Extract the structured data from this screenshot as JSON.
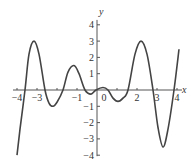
{
  "chart_data": {
    "type": "line",
    "title": "",
    "xlabel": "x",
    "ylabel": "y",
    "xlim": [
      -4,
      4.2
    ],
    "ylim": [
      -4,
      4.3
    ],
    "x_ticks": [
      -4,
      -3,
      -1,
      0,
      2,
      3,
      4
    ],
    "x_tick_labels": [
      "−4",
      "−3",
      "−1",
      "0",
      "2",
      "3",
      "4"
    ],
    "x_tick_marks": [
      -4,
      -3,
      -2,
      -1,
      1,
      2,
      3,
      4
    ],
    "y_ticks": [
      4,
      3,
      2,
      1,
      -1,
      -2,
      -3,
      -4
    ],
    "y_tick_labels": [
      "4",
      "3",
      "2",
      "1",
      "−1",
      "−2",
      "−3",
      "−4"
    ],
    "grid": false,
    "legend": "none",
    "series": [
      {
        "name": "f(x)",
        "color": "#444444",
        "x": [
          -4.0,
          -3.85,
          -3.6,
          -3.4,
          -3.15,
          -2.9,
          -2.6,
          -2.4,
          -2.2,
          -2.0,
          -1.7,
          -1.45,
          -1.15,
          -0.9,
          -0.6,
          -0.3,
          -0.05,
          0.3,
          0.55,
          0.8,
          1.05,
          1.3,
          1.55,
          1.9,
          2.2,
          2.5,
          2.8,
          3.05,
          3.3,
          3.55,
          3.85,
          4.1
        ],
        "y": [
          -4.0,
          -2.4,
          0.0,
          2.2,
          3.0,
          2.2,
          0.0,
          -0.8,
          -1.0,
          -0.75,
          0.0,
          1.1,
          1.5,
          1.0,
          0.0,
          -0.25,
          0.0,
          0.15,
          0.0,
          -0.5,
          -0.7,
          -0.5,
          0.0,
          2.2,
          3.0,
          2.2,
          0.0,
          -2.3,
          -3.5,
          -2.4,
          0.0,
          2.5
        ]
      }
    ]
  }
}
